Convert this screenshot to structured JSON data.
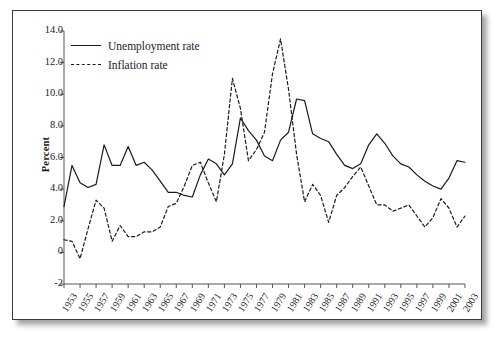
{
  "chart_data": {
    "type": "line",
    "title": "",
    "xlabel": "",
    "ylabel": "Percent",
    "xlim": [
      1953,
      2003
    ],
    "ylim": [
      -2,
      14
    ],
    "grid": false,
    "legend_position": "top-left",
    "y_ticks": [
      "-2",
      "0",
      "2.0",
      "4.0",
      "6.0",
      "8.0",
      "10.0",
      "12.0",
      "14.0"
    ],
    "y_tick_values": [
      -2,
      0,
      2,
      4,
      6,
      8,
      10,
      12,
      14
    ],
    "x_ticks": [
      "1953",
      "1955",
      "1957",
      "1959",
      "1961",
      "1963",
      "1965",
      "1967",
      "1969",
      "1971",
      "1973",
      "1975",
      "1977",
      "1979",
      "1981",
      "1983",
      "1985",
      "1987",
      "1989",
      "1991",
      "1993",
      "1995",
      "1997",
      "1999",
      "2001",
      "2003"
    ],
    "x": [
      1953,
      1954,
      1955,
      1956,
      1957,
      1958,
      1959,
      1960,
      1961,
      1962,
      1963,
      1964,
      1965,
      1966,
      1967,
      1968,
      1969,
      1970,
      1971,
      1972,
      1973,
      1974,
      1975,
      1976,
      1977,
      1978,
      1979,
      1980,
      1981,
      1982,
      1983,
      1984,
      1985,
      1986,
      1987,
      1988,
      1989,
      1990,
      1991,
      1992,
      1993,
      1994,
      1995,
      1996,
      1997,
      1998,
      1999,
      2000,
      2001,
      2002,
      2003
    ],
    "series": [
      {
        "name": "Unemployment rate",
        "style": "solid",
        "color": "#1a1a1a",
        "values": [
          2.9,
          5.5,
          4.4,
          4.1,
          4.3,
          6.8,
          5.5,
          5.5,
          6.7,
          5.5,
          5.7,
          5.2,
          4.5,
          3.8,
          3.8,
          3.6,
          3.5,
          4.9,
          5.9,
          5.6,
          4.9,
          5.6,
          8.5,
          7.7,
          7.1,
          6.1,
          5.8,
          7.1,
          7.6,
          9.7,
          9.6,
          7.5,
          7.2,
          7.0,
          6.2,
          5.5,
          5.3,
          5.6,
          6.8,
          7.5,
          6.9,
          6.1,
          5.6,
          5.4,
          4.9,
          4.5,
          4.2,
          4.0,
          4.7,
          5.8,
          5.7
        ]
      },
      {
        "name": "Inflation rate",
        "style": "dashed",
        "color": "#1a1a1a",
        "values": [
          0.8,
          0.7,
          -0.4,
          1.5,
          3.3,
          2.8,
          0.7,
          1.7,
          1.0,
          1.0,
          1.3,
          1.3,
          1.6,
          2.9,
          3.1,
          4.2,
          5.5,
          5.7,
          4.4,
          3.2,
          6.2,
          11.0,
          9.1,
          5.8,
          6.5,
          7.6,
          11.3,
          13.5,
          10.3,
          6.2,
          3.2,
          4.3,
          3.6,
          1.9,
          3.6,
          4.1,
          4.8,
          5.4,
          4.2,
          3.0,
          3.0,
          2.6,
          2.8,
          3.0,
          2.3,
          1.6,
          2.2,
          3.4,
          2.8,
          1.6,
          2.3
        ]
      }
    ]
  },
  "legend": {
    "items": [
      {
        "label": "Unemployment rate",
        "style": "solid"
      },
      {
        "label": "Inflation rate",
        "style": "dashed"
      }
    ]
  },
  "axis": {
    "y_title": "Percent"
  }
}
